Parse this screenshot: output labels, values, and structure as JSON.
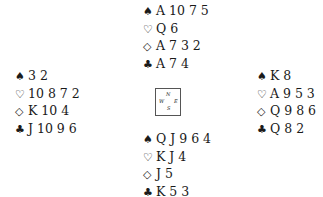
{
  "hands": {
    "north": {
      "spades": "A 10 7 5",
      "hearts": "Q 6",
      "diamonds": "A 7 3 2",
      "clubs": "A 7 4"
    },
    "west": {
      "spades": "3 2",
      "hearts": "10 8 7 2",
      "diamonds": "K 10 4",
      "clubs": "J 10 9 6"
    },
    "east": {
      "spades": "K 8",
      "hearts": "A 9 5 3",
      "diamonds": "Q 9 8 6",
      "clubs": "Q 8 2"
    },
    "south": {
      "spades": "Q J 9 6 4",
      "hearts": "K J 4",
      "diamonds": "J 5",
      "clubs": "K 5 3"
    }
  },
  "symbols": {
    "spades": "♠",
    "hearts": "♡",
    "diamonds": "◇",
    "clubs": "♣"
  },
  "compass": {
    "n": "N",
    "w": "W",
    "e": "E",
    "s": "S"
  }
}
